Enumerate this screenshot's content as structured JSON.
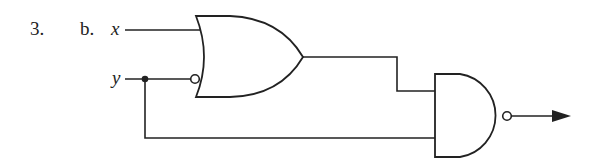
{
  "problem": {
    "number": "3.",
    "part": "b."
  },
  "inputs": [
    {
      "name": "x"
    },
    {
      "name": "y"
    }
  ],
  "gates": [
    {
      "type": "OR",
      "inverted_inputs": [
        "y"
      ],
      "description": "OR gate with inverted y input"
    },
    {
      "type": "NAND",
      "inputs": [
        "OR output",
        "y"
      ],
      "description": "NAND gate producing circuit output"
    }
  ],
  "colors": {
    "line": "#222222",
    "background": "#ffffff"
  }
}
